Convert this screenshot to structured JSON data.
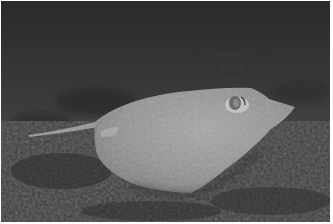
{
  "image": {
    "subject": "stingray resting on seafloor",
    "style": "grayscale underwater photograph",
    "colors": {
      "water_top": "#2e2e2e",
      "water_mid": "#4a4a4a",
      "seafloor": "#3c3c3c",
      "ray_body": "#9a9a9a",
      "ray_highlight": "#b8b8b8",
      "border": "#ffffff"
    }
  }
}
